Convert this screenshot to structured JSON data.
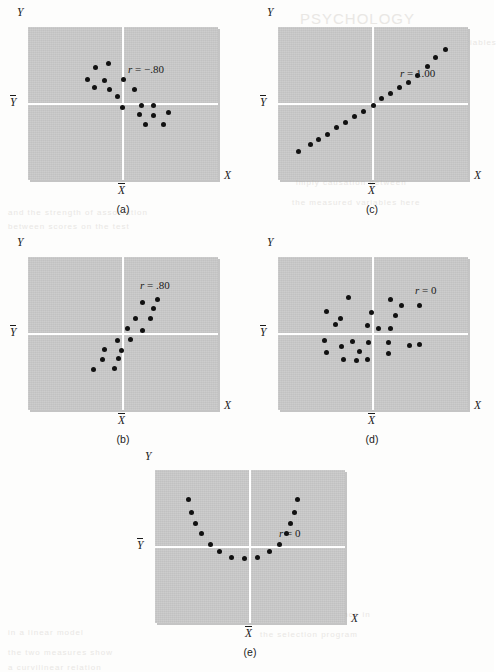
{
  "figure": {
    "axis_x_label": "X",
    "axis_y_label": "Y",
    "axis_xbar_label": "X",
    "axis_ybar_label": "Y",
    "panel_bg_color": "#c8c8c8",
    "dot_color": "#111111",
    "axis_line_color": "#ffffff"
  },
  "bleed_text": [
    {
      "text": "PSYCHOLOGY",
      "x": 300,
      "y": 10,
      "size": 15
    },
    {
      "text": "the correlation between these two variables",
      "x": 300,
      "y": 38,
      "size": 8
    },
    {
      "text": "a perfect linear relationship exists",
      "x": 300,
      "y": 58,
      "size": 8
    },
    {
      "text": "scatterplot shows no relationship",
      "x": 295,
      "y": 78,
      "size": 8
    },
    {
      "text": "values of one variable",
      "x": 300,
      "y": 98,
      "size": 8
    },
    {
      "text": "of the data points",
      "x": 300,
      "y": 118,
      "size": 8
    },
    {
      "text": "statistical analysis",
      "x": 300,
      "y": 138,
      "size": 8
    },
    {
      "text": "correlation does not",
      "x": 300,
      "y": 158,
      "size": 8
    },
    {
      "text": "imply causation between",
      "x": 296,
      "y": 178,
      "size": 8
    },
    {
      "text": "the measured variables here",
      "x": 292,
      "y": 198,
      "size": 8
    },
    {
      "text": "in a linear model",
      "x": 8,
      "y": 628,
      "size": 8
    },
    {
      "text": "the two measures show",
      "x": 8,
      "y": 648,
      "size": 8
    },
    {
      "text": "a curvilinear relation",
      "x": 8,
      "y": 663,
      "size": 8
    },
    {
      "text": "and the strength of association",
      "x": 8,
      "y": 208,
      "size": 8
    },
    {
      "text": "between scores on the test",
      "x": 8,
      "y": 222,
      "size": 8
    },
    {
      "text": "and later performance in",
      "x": 260,
      "y": 610,
      "size": 8
    },
    {
      "text": "the selection program",
      "x": 260,
      "y": 630,
      "size": 8
    }
  ],
  "chart_data": [
    {
      "id": "a",
      "type": "scatter",
      "caption": "(a)",
      "r_label": "r = −.80",
      "r_value": -0.8,
      "title": "",
      "xlabel": "X",
      "ylabel": "Y",
      "xlim": [
        0,
        1
      ],
      "ylim": [
        0,
        1
      ],
      "grid": false,
      "mean_x": 0.5,
      "mean_y": 0.5,
      "points": [
        [
          0.355,
          0.735
        ],
        [
          0.425,
          0.76
        ],
        [
          0.315,
          0.66
        ],
        [
          0.4,
          0.65
        ],
        [
          0.5,
          0.655
        ],
        [
          0.35,
          0.605
        ],
        [
          0.43,
          0.59
        ],
        [
          0.56,
          0.59
        ],
        [
          0.47,
          0.545
        ],
        [
          0.495,
          0.475
        ],
        [
          0.595,
          0.49
        ],
        [
          0.66,
          0.485
        ],
        [
          0.585,
          0.425
        ],
        [
          0.66,
          0.42
        ],
        [
          0.74,
          0.44
        ],
        [
          0.62,
          0.365
        ],
        [
          0.715,
          0.36
        ]
      ]
    },
    {
      "id": "b",
      "type": "scatter",
      "caption": "(b)",
      "r_label": "r = .80",
      "r_value": 0.8,
      "title": "",
      "xlabel": "X",
      "ylabel": "Y",
      "xlim": [
        0,
        1
      ],
      "ylim": [
        0,
        1
      ],
      "grid": false,
      "mean_x": 0.5,
      "mean_y": 0.5,
      "points": [
        [
          0.345,
          0.265
        ],
        [
          0.455,
          0.27
        ],
        [
          0.39,
          0.33
        ],
        [
          0.475,
          0.335
        ],
        [
          0.4,
          0.395
        ],
        [
          0.49,
          0.39
        ],
        [
          0.47,
          0.455
        ],
        [
          0.54,
          0.46
        ],
        [
          0.525,
          0.53
        ],
        [
          0.6,
          0.52
        ],
        [
          0.565,
          0.6
        ],
        [
          0.645,
          0.595
        ],
        [
          0.66,
          0.665
        ],
        [
          0.6,
          0.7
        ],
        [
          0.68,
          0.72
        ]
      ]
    },
    {
      "id": "c",
      "type": "scatter",
      "caption": "(c)",
      "r_label": "r = 1.00",
      "r_value": 1.0,
      "title": "",
      "xlabel": "X",
      "ylabel": "Y",
      "xlim": [
        0,
        1
      ],
      "ylim": [
        0,
        1
      ],
      "grid": false,
      "mean_x": 0.5,
      "mean_y": 0.5,
      "points": [
        [
          0.11,
          0.185
        ],
        [
          0.17,
          0.23
        ],
        [
          0.215,
          0.265
        ],
        [
          0.26,
          0.3
        ],
        [
          0.31,
          0.34
        ],
        [
          0.355,
          0.375
        ],
        [
          0.4,
          0.415
        ],
        [
          0.45,
          0.45
        ],
        [
          0.5,
          0.49
        ],
        [
          0.545,
          0.53
        ],
        [
          0.59,
          0.565
        ],
        [
          0.64,
          0.605
        ],
        [
          0.685,
          0.64
        ],
        [
          0.735,
          0.68
        ],
        [
          0.785,
          0.745
        ],
        [
          0.83,
          0.8
        ],
        [
          0.88,
          0.855
        ]
      ]
    },
    {
      "id": "d",
      "type": "scatter",
      "caption": "(d)",
      "r_label": "r = 0",
      "r_value": 0,
      "title": "",
      "xlabel": "X",
      "ylabel": "Y",
      "xlim": [
        0,
        1
      ],
      "ylim": [
        0,
        1
      ],
      "grid": false,
      "mean_x": 0.5,
      "mean_y": 0.5,
      "points": [
        [
          0.37,
          0.735
        ],
        [
          0.59,
          0.725
        ],
        [
          0.65,
          0.68
        ],
        [
          0.745,
          0.68
        ],
        [
          0.255,
          0.645
        ],
        [
          0.49,
          0.64
        ],
        [
          0.62,
          0.62
        ],
        [
          0.33,
          0.595
        ],
        [
          0.3,
          0.56
        ],
        [
          0.47,
          0.555
        ],
        [
          0.59,
          0.535
        ],
        [
          0.53,
          0.53
        ],
        [
          0.245,
          0.455
        ],
        [
          0.39,
          0.45
        ],
        [
          0.475,
          0.44
        ],
        [
          0.58,
          0.44
        ],
        [
          0.335,
          0.415
        ],
        [
          0.69,
          0.42
        ],
        [
          0.745,
          0.425
        ],
        [
          0.255,
          0.375
        ],
        [
          0.43,
          0.38
        ],
        [
          0.58,
          0.37
        ],
        [
          0.345,
          0.33
        ],
        [
          0.415,
          0.325
        ],
        [
          0.47,
          0.33
        ]
      ]
    },
    {
      "id": "e",
      "type": "scatter",
      "caption": "(e)",
      "r_label": "r = 0",
      "r_value": 0,
      "title": "",
      "xlabel": "X",
      "ylabel": "Y",
      "xlim": [
        0,
        1
      ],
      "ylim": [
        0,
        1
      ],
      "grid": false,
      "mean_x": 0.5,
      "mean_y": 0.5,
      "points": [
        [
          0.175,
          0.81
        ],
        [
          0.19,
          0.725
        ],
        [
          0.215,
          0.65
        ],
        [
          0.245,
          0.585
        ],
        [
          0.29,
          0.51
        ],
        [
          0.34,
          0.465
        ],
        [
          0.4,
          0.43
        ],
        [
          0.47,
          0.42
        ],
        [
          0.54,
          0.43
        ],
        [
          0.6,
          0.465
        ],
        [
          0.655,
          0.51
        ],
        [
          0.69,
          0.585
        ],
        [
          0.715,
          0.65
        ],
        [
          0.735,
          0.725
        ],
        [
          0.75,
          0.81
        ]
      ]
    }
  ]
}
